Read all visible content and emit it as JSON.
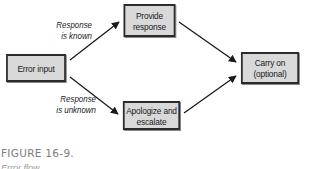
{
  "diagram": {
    "type": "flowchart",
    "nodes": {
      "error_input": {
        "lines": [
          "Error input"
        ]
      },
      "provide_response": {
        "lines": [
          "Provide",
          "response"
        ]
      },
      "apologize_escalate": {
        "lines": [
          "Apologize and",
          "escalate"
        ]
      },
      "carry_on": {
        "lines": [
          "Carry on",
          "(optional)"
        ]
      }
    },
    "edges": [
      {
        "from": "error_input",
        "to": "provide_response",
        "label_lines": [
          "Response",
          "is known"
        ]
      },
      {
        "from": "error_input",
        "to": "apologize_escalate",
        "label_lines": [
          "Response",
          "is unknown"
        ]
      },
      {
        "from": "provide_response",
        "to": "carry_on"
      },
      {
        "from": "apologize_escalate",
        "to": "carry_on"
      }
    ],
    "colors": {
      "node_fill": "#d9d9d9",
      "node_border": "#2b2b2b",
      "edge": "#1a1a1a",
      "caption": "#7d7d7d"
    }
  },
  "caption": {
    "figure_label": "FIGURE 16-9.",
    "subtitle": "Error flow"
  }
}
